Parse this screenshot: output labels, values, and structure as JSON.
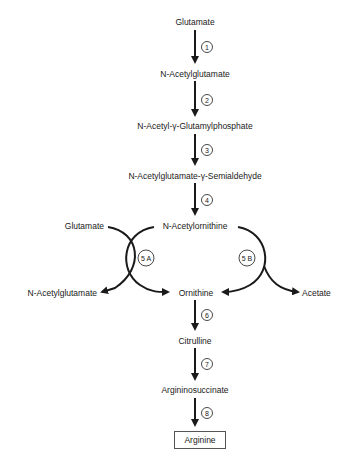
{
  "nodes": {
    "glutamate": "Glutamate",
    "n_acetylglutamate": "N-Acetylglutamate",
    "n_acetyl_glutamylphosphate": "N-Acetyl-γ-Glutamylphosphate",
    "n_acetylglutamate_semialdehyde": "N-Acetylglutamate-γ-Semialdehyde",
    "n_acetylornithine": "N-Acetylornithine",
    "glutamate_side": "Glutamate",
    "n_acetylglutamate_side": "N-Acetylglutamate",
    "ornithine": "Ornithine",
    "acetate": "Acetate",
    "citrulline": "Citrulline",
    "argininosuccinate": "Argininosuccinate",
    "arginine": "Arginine"
  },
  "steps": {
    "s1": "1",
    "s2": "2",
    "s3": "3",
    "s4": "4",
    "s5a": "5 A",
    "s5b": "5 B",
    "s6": "6",
    "s7": "7",
    "s8": "8"
  },
  "colors": {
    "line": "#1a1a1a",
    "box_border": "#555555"
  }
}
